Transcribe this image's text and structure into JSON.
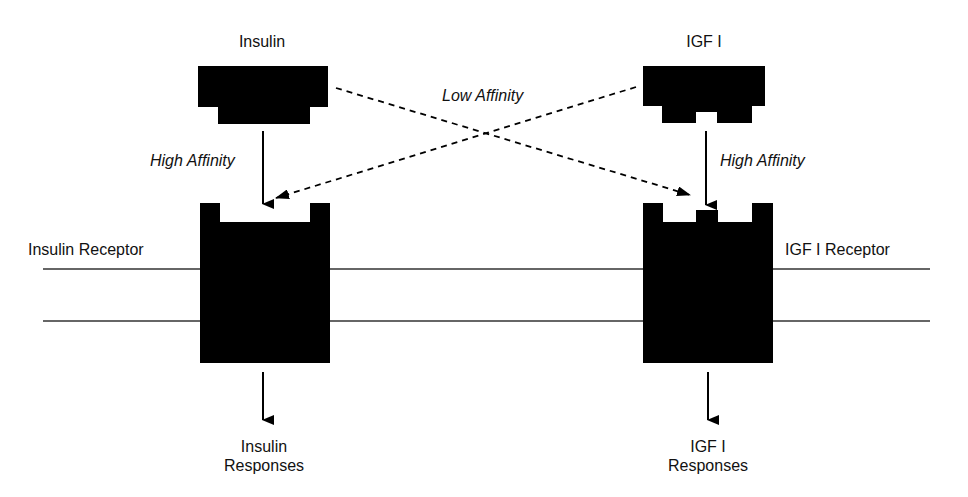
{
  "ligands": {
    "insulin": {
      "label": "Insulin"
    },
    "igf1": {
      "label": "IGF I"
    }
  },
  "affinity": {
    "low": "Low Affinity",
    "insulin_high": "High Affinity",
    "igf1_high": "High Affinity"
  },
  "receptors": {
    "insulin": {
      "label": "Insulin Receptor"
    },
    "igf1": {
      "label": "IGF I Receptor"
    }
  },
  "responses": {
    "insulin": {
      "line1": "Insulin",
      "line2": "Responses"
    },
    "igf1": {
      "line1": "IGF I",
      "line2": "Responses"
    }
  },
  "colors": {
    "shape": "#000000",
    "line": "#333333",
    "background": "#ffffff"
  }
}
